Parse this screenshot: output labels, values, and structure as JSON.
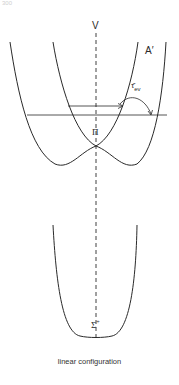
{
  "page": {
    "number": "300"
  },
  "diagram": {
    "type": "potential-energy-curves",
    "axis_label": "V",
    "upper_states": [
      {
        "label": "A′",
        "shape": "single-well"
      },
      {
        "label": "Π",
        "shape": "degenerate-point-at-linear-geometry"
      }
    ],
    "lower_state": {
      "label_main": "Σ",
      "label_sup": "+"
    },
    "transition_label": {
      "main": "τ̂",
      "sub": "ev"
    },
    "caption": "linear configuration",
    "colors": {
      "line": "#2a2a2a",
      "background": "#ffffff"
    }
  }
}
